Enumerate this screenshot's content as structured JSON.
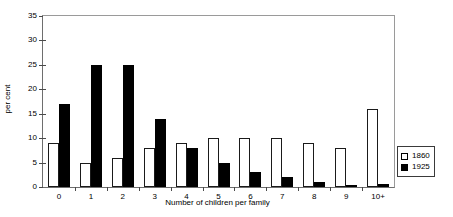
{
  "chart_data": {
    "type": "bar",
    "title": "",
    "xlabel": "Number of children per family",
    "ylabel": "per cent",
    "categories": [
      "0",
      "1",
      "2",
      "3",
      "4",
      "5",
      "6",
      "7",
      "8",
      "9",
      "10+"
    ],
    "series": [
      {
        "name": "1860",
        "color": "#ffffff",
        "values": [
          9,
          5,
          6,
          8,
          9,
          10,
          10,
          10,
          9,
          8,
          16
        ]
      },
      {
        "name": "1925",
        "color": "#000000",
        "values": [
          17,
          25,
          25,
          14,
          8,
          5,
          3,
          2,
          1,
          0.4,
          0.6
        ]
      }
    ],
    "ylim": [
      0,
      35
    ],
    "yticks": [
      0,
      5,
      10,
      15,
      20,
      25,
      30,
      35
    ],
    "ytick_labels": [
      "0",
      "5",
      "10",
      "15",
      "20",
      "25",
      "30",
      "35"
    ],
    "grid": false,
    "legend_position": "right-bottom"
  },
  "legend": {
    "entries": [
      {
        "label": "1860",
        "swatch": "open-square-swatch"
      },
      {
        "label": "1925",
        "swatch": "filled-square-swatch"
      }
    ]
  }
}
